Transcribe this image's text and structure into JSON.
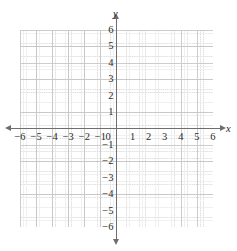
{
  "figure": {
    "kind": "cartesian-coordinate-grid",
    "background_color": "#ffffff",
    "axis_color": "#6e6e6e",
    "grid_color": "#c9c9c9",
    "label_color": "#2b2b2b"
  },
  "chart_data": {
    "type": "scatter",
    "title": "",
    "subtitle": "",
    "xlabel": "x",
    "ylabel": "y",
    "xlim": [
      -6,
      6
    ],
    "ylim": [
      -6,
      6
    ],
    "grid": true,
    "minor_grid": true,
    "minor_ticks_per_unit": 5,
    "legend": null,
    "legend_position": "none",
    "annotations": [],
    "series": [],
    "x_tick_labels": [
      "−6",
      "−5",
      "−4",
      "−3",
      "−2",
      "−1",
      "0",
      "1",
      "2",
      "3",
      "4",
      "5",
      "6"
    ],
    "x_tick_values": [
      -6,
      -5,
      -4,
      -3,
      -2,
      -1,
      0,
      1,
      2,
      3,
      4,
      5,
      6
    ],
    "y_tick_labels": [
      "6",
      "5",
      "4",
      "3",
      "2",
      "1",
      "−1",
      "−2",
      "−3",
      "−4",
      "−5",
      "−6"
    ],
    "y_tick_values": [
      6,
      5,
      4,
      3,
      2,
      1,
      -1,
      -2,
      -3,
      -4,
      -5,
      -6
    ],
    "origin_label": "0"
  },
  "axis_names": {
    "x": "x",
    "y": "y"
  }
}
